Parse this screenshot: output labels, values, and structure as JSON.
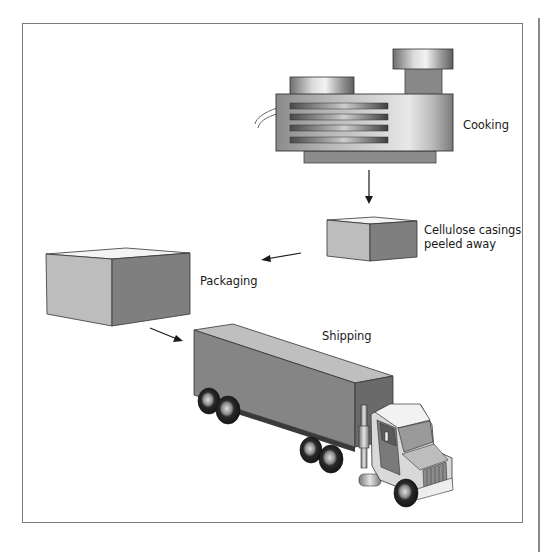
{
  "diagram": {
    "stages": [
      {
        "id": "cooking",
        "label": "Cooking"
      },
      {
        "id": "peeling",
        "label_line1": "Cellulose casings",
        "label_line2": "peeled away"
      },
      {
        "id": "packaging",
        "label": "Packaging"
      },
      {
        "id": "shipping",
        "label": "Shipping"
      }
    ],
    "flow": [
      "Cooking",
      "Cellulose casings peeled away",
      "Packaging",
      "Shipping"
    ],
    "colors": {
      "frame": "#7a7a7a",
      "box_light": "#bdbdbd",
      "box_dark": "#7f7f7f",
      "box_top": "#f4f4f4",
      "arrow": "#1a1a1a"
    }
  }
}
